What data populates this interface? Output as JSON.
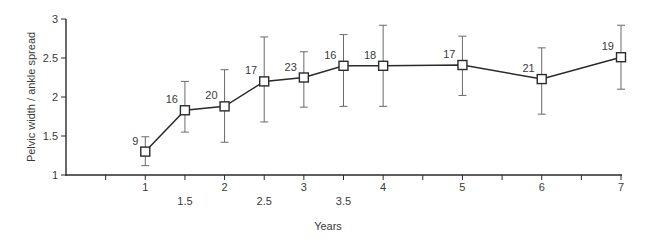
{
  "chart_data": {
    "type": "line",
    "title": "",
    "xlabel": "Years",
    "ylabel": "Pelvic width / ankle spread",
    "xlim": [
      0,
      7
    ],
    "ylim": [
      1,
      3
    ],
    "grid": false,
    "legend": null,
    "x_ticks_major": [
      1,
      2,
      3,
      4,
      5,
      6,
      7
    ],
    "x_ticks_half": [
      1.5,
      2.5,
      3.5
    ],
    "x_tick_marks": [
      0.5,
      1,
      1.5,
      2,
      2.5,
      3,
      3.5,
      4,
      4.5,
      5,
      5.5,
      6,
      6.5,
      7
    ],
    "y_ticks": [
      1,
      1.5,
      2,
      2.5,
      3
    ],
    "y_tick_labels": [
      "1",
      "1.5",
      "2",
      "2.5",
      "3"
    ],
    "marker": "open-square",
    "series": [
      {
        "name": "Pelvic width / ankle spread",
        "x": [
          1,
          1.5,
          2,
          2.5,
          3,
          3.5,
          4,
          5,
          6,
          7
        ],
        "y": [
          1.3,
          1.83,
          1.88,
          2.2,
          2.25,
          2.4,
          2.4,
          2.41,
          2.23,
          2.51
        ],
        "error_upper": [
          1.49,
          2.2,
          2.35,
          2.77,
          2.58,
          2.8,
          2.92,
          2.78,
          2.63,
          2.92
        ],
        "error_lower": [
          1.12,
          1.55,
          1.42,
          1.68,
          1.87,
          1.88,
          1.88,
          2.02,
          1.78,
          2.1
        ],
        "n_labels": [
          "9",
          "16",
          "20",
          "17",
          "23",
          "16",
          "18",
          "17",
          "21",
          "19"
        ]
      }
    ]
  },
  "colors": {
    "line": "#2a2a2a",
    "errorbar": "#6a6a6a",
    "axis": "#2a2a2a",
    "text": "#3a3a3a",
    "marker_fill": "#ffffff"
  }
}
